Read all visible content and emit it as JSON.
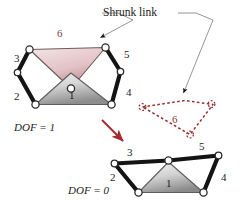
{
  "figure": {
    "title_callout": "Shrunk link",
    "colors": {
      "link_gray_light": "#e9e9e9",
      "link_gray_dark": "#8f8f8f",
      "link_pink_light": "#efdadc",
      "link_pink_dark": "#c08d94",
      "bar_black": "#141414",
      "dashed_red": "#9b2f33",
      "label_red": "#8d3b41",
      "label_black": "#1b1b1b",
      "leader_gray": "#8a8a8a",
      "arrow_red": "#a52a2f",
      "pivot_fill": "#ffffff"
    },
    "upper_mechanism": {
      "dof_label": "DOF = 1",
      "link_labels": {
        "link6": "6",
        "link3": "3",
        "link2": "2",
        "link5": "5",
        "link4": "4",
        "link1": "1"
      }
    },
    "shrunk_link_diagram": {
      "label": "6"
    },
    "lower_mechanism": {
      "dof_label": "DOF = 0",
      "link_labels": {
        "link3": "3",
        "link2": "2",
        "link5": "5",
        "link4": "4",
        "link1": "1"
      }
    }
  }
}
